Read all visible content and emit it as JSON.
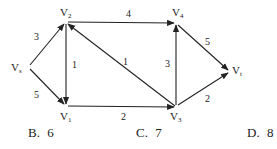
{
  "graph": {
    "type": "directed-network",
    "nodes": [
      {
        "id": "vs",
        "label": "V",
        "sub": "s",
        "x": 28,
        "y": 67
      },
      {
        "id": "v2",
        "label": "V",
        "sub": "2",
        "x": 66,
        "y": 22
      },
      {
        "id": "v1",
        "label": "V",
        "sub": "1",
        "x": 66,
        "y": 106
      },
      {
        "id": "v4",
        "label": "V",
        "sub": "4",
        "x": 176,
        "y": 23
      },
      {
        "id": "v3",
        "label": "V",
        "sub": "3",
        "x": 176,
        "y": 107
      },
      {
        "id": "vt",
        "label": "V",
        "sub": "t",
        "x": 230,
        "y": 71
      }
    ],
    "edges": [
      {
        "from": "vs",
        "to": "v2",
        "weight": "3"
      },
      {
        "from": "vs",
        "to": "v1",
        "weight": "5"
      },
      {
        "from": "v2",
        "to": "v4",
        "weight": "4"
      },
      {
        "from": "v2",
        "to": "v1",
        "weight": "1"
      },
      {
        "from": "v3",
        "to": "v2",
        "weight": "1"
      },
      {
        "from": "v1",
        "to": "v3",
        "weight": "2"
      },
      {
        "from": "v3",
        "to": "v4",
        "weight": "3"
      },
      {
        "from": "v4",
        "to": "vt",
        "weight": "5"
      },
      {
        "from": "v3",
        "to": "vt",
        "weight": "2"
      }
    ]
  },
  "options": [
    {
      "letter": "B.",
      "value": "6"
    },
    {
      "letter": "C.",
      "value": "7"
    },
    {
      "letter": "D.",
      "value": "8"
    }
  ]
}
